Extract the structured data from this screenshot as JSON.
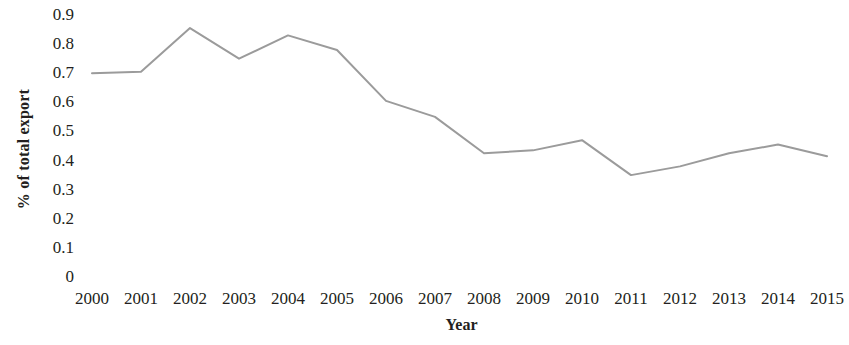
{
  "chart_data": {
    "type": "line",
    "title": "",
    "xlabel": "Year",
    "ylabel": "% of total export",
    "categories": [
      "2000",
      "2001",
      "2002",
      "2003",
      "2004",
      "2005",
      "2006",
      "2007",
      "2008",
      "2009",
      "2010",
      "2011",
      "2012",
      "2013",
      "2014",
      "2015"
    ],
    "values": [
      0.7,
      0.705,
      0.855,
      0.75,
      0.83,
      0.78,
      0.605,
      0.55,
      0.425,
      0.435,
      0.47,
      0.35,
      0.38,
      0.425,
      0.455,
      0.415
    ],
    "series": [
      {
        "name": "% of total export",
        "values": [
          0.7,
          0.705,
          0.855,
          0.75,
          0.83,
          0.78,
          0.605,
          0.55,
          0.425,
          0.435,
          0.47,
          0.35,
          0.38,
          0.425,
          0.455,
          0.415
        ]
      }
    ],
    "ylim": [
      0,
      0.9
    ],
    "ytick_labels": [
      "0.9",
      "0.8",
      "0.7",
      "0.6",
      "0.5",
      "0.4",
      "0.3",
      "0.2",
      "0.1",
      "0"
    ],
    "ytick_values": [
      0.9,
      0.8,
      0.7,
      0.6,
      0.5,
      0.4,
      0.3,
      0.2,
      0.1,
      0
    ],
    "grid": false,
    "legend": "none",
    "line_color": "#9b9b9b",
    "line_width": 2,
    "markers": false,
    "background_color": "#ffffff",
    "text_color": "#231f20"
  }
}
